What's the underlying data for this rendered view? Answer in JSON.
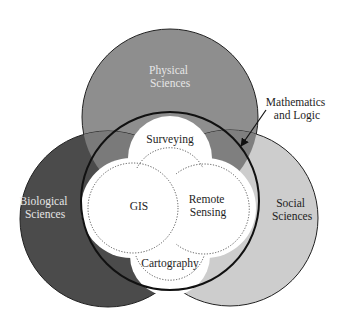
{
  "diagram": {
    "type": "venn",
    "colors": {
      "physical": "#8e8e8e",
      "biological": "#4b4b4b",
      "social": "#cdcdcd",
      "math_outline": "#111111",
      "core_fill": "#ffffff",
      "dotted": "#555555"
    },
    "outer_sets": {
      "physical": {
        "line1": "Physical",
        "line2": "Sciences"
      },
      "biological": {
        "line1": "Biological",
        "line2": "Sciences"
      },
      "social": {
        "line1": "Social",
        "line2": "Sciences"
      }
    },
    "callout": {
      "line1": "Mathematics",
      "line2": "and Logic",
      "target": "math-circle"
    },
    "core_sets": {
      "surveying": "Surveying",
      "gis": "GIS",
      "remote_sensing": {
        "line1": "Remote",
        "line2": "Sensing"
      },
      "cartography": "Cartography"
    }
  }
}
